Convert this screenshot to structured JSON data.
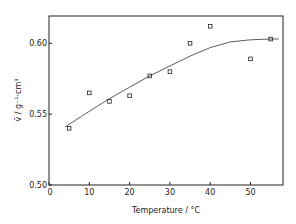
{
  "chart_data": {
    "type": "scatter",
    "title": "",
    "xlabel": "Temperature  / °C",
    "ylabel": "v̄  /  g⁻¹·cm³",
    "xlim": [
      0,
      58
    ],
    "ylim": [
      0.5,
      0.62
    ],
    "x_ticks": [
      0,
      10,
      20,
      30,
      40,
      50
    ],
    "x_tick_labels": [
      "0",
      "10",
      "20",
      "30",
      "40",
      "50"
    ],
    "y_ticks": [
      0.5,
      0.55,
      0.6
    ],
    "y_tick_labels": [
      "0.50",
      "0.55",
      "0.60"
    ],
    "grid": false,
    "series": [
      {
        "name": "measured",
        "marker": "open-square",
        "x": [
          5,
          10,
          15,
          20,
          25,
          30,
          35,
          40,
          50,
          55
        ],
        "y": [
          0.54,
          0.565,
          0.559,
          0.563,
          0.577,
          0.58,
          0.6,
          0.612,
          0.589,
          0.603
        ]
      },
      {
        "name": "fit",
        "style": "line",
        "x": [
          4,
          10,
          15,
          20,
          25,
          30,
          35,
          40,
          45,
          50,
          55,
          57
        ],
        "y": [
          0.541,
          0.552,
          0.561,
          0.569,
          0.577,
          0.584,
          0.591,
          0.597,
          0.601,
          0.6025,
          0.603,
          0.603
        ]
      }
    ]
  }
}
